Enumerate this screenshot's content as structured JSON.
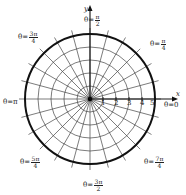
{
  "diagram": {
    "center": {
      "x": 90,
      "y": 99
    },
    "unit_px": 13,
    "outer_radius": 5,
    "ray_step_deg": 15,
    "colors": {
      "grid": "#444444",
      "outer_circle": "#111111",
      "text": "#222222"
    },
    "axes": {
      "x_label": "x",
      "y_label": "y"
    },
    "radial_ticks": [
      "1",
      "2",
      "3",
      "4",
      "5"
    ],
    "angle_labels": [
      {
        "id": "theta-0",
        "prefix": "θ=",
        "value": "0",
        "frac": false
      },
      {
        "id": "theta-pi-4",
        "prefix": "θ=",
        "num": "π",
        "den": "4",
        "frac": true
      },
      {
        "id": "theta-pi-2",
        "prefix": "θ=",
        "num": "π",
        "den": "2",
        "frac": true
      },
      {
        "id": "theta-3pi-4",
        "prefix": "θ=",
        "num": "3π",
        "den": "4",
        "frac": true
      },
      {
        "id": "theta-pi",
        "prefix": "θ=",
        "value": "π",
        "frac": false
      },
      {
        "id": "theta-5pi-4",
        "prefix": "θ=",
        "num": "5π",
        "den": "4",
        "frac": true
      },
      {
        "id": "theta-3pi-2",
        "prefix": "θ=",
        "num": "3π",
        "den": "2",
        "frac": true
      },
      {
        "id": "theta-7pi-4",
        "prefix": "θ=",
        "num": "7π",
        "den": "4",
        "frac": true
      }
    ]
  }
}
